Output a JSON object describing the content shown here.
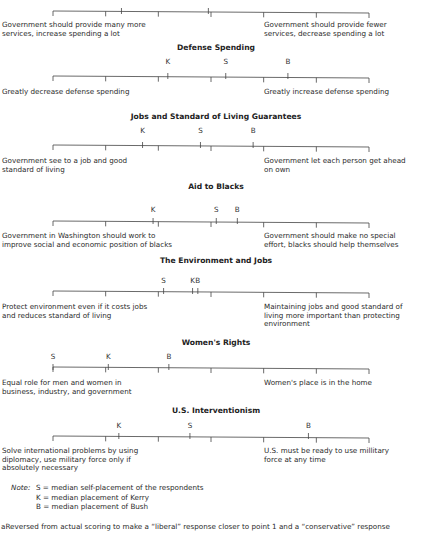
{
  "scale": {
    "x_start": 53,
    "x_end": 369,
    "points": 7
  },
  "sections": [
    {
      "id": "services",
      "title": "",
      "line_y": 12,
      "extra_ticks": [
        2.3,
        3.95
      ],
      "markers": [],
      "left_text": [
        "Government should provide many more",
        "services, increase spending a lot"
      ],
      "right_text": [
        "Government should provide fewer",
        "services, decrease spending a lot"
      ],
      "text_y": 21
    },
    {
      "id": "defense",
      "title": "Defense Spending",
      "title_y": 43,
      "marker_y": 57,
      "line_y": 77,
      "markers": [
        {
          "label": "K",
          "value": 3.18
        },
        {
          "label": "S",
          "value": 4.28
        },
        {
          "label": "B",
          "value": 5.46
        }
      ],
      "left_text": [
        "Greatly decrease defense spending"
      ],
      "right_text": [
        "Greatly increase defense spending"
      ],
      "text_y": 88
    },
    {
      "id": "jobs",
      "title": "Jobs and Standard of Living Guarantees",
      "title_y": 112,
      "marker_y": 126,
      "line_y": 146,
      "markers": [
        {
          "label": "K",
          "value": 2.7
        },
        {
          "label": "S",
          "value": 3.8
        },
        {
          "label": "B",
          "value": 4.8
        }
      ],
      "left_text": [
        "Government see to a job and good",
        "standard of living"
      ],
      "right_text": [
        "Government let each person get ahead",
        "on own"
      ],
      "text_y": 157
    },
    {
      "id": "aid",
      "title": "Aid to Blacks",
      "title_y": 182,
      "marker_y": 205,
      "line_y": 222,
      "markers": [
        {
          "label": "K",
          "value": 2.9
        },
        {
          "label": "S",
          "value": 4.1
        },
        {
          "label": "B",
          "value": 4.5
        }
      ],
      "left_text": [
        "Government in Washington should work to",
        "improve social and economic position of blacks"
      ],
      "right_text": [
        "Government should make no special",
        "effort, blacks should help themselves"
      ],
      "text_y": 232
    },
    {
      "id": "environment",
      "title": "The Environment and Jobs",
      "title_y": 256,
      "marker_y": 276,
      "line_y": 292,
      "markers": [
        {
          "label": "S",
          "value": 3.1
        },
        {
          "label": "K",
          "value": 3.65
        },
        {
          "label": "B",
          "value": 3.75
        }
      ],
      "left_text": [
        "Protect environment even if it costs jobs",
        "and reduces standard of living"
      ],
      "right_text": [
        "Maintaining jobs and good standard of",
        "living more important than protecting",
        "environment"
      ],
      "text_y": 303
    },
    {
      "id": "women",
      "title": "Women's Rights",
      "title_y": 338,
      "marker_y": 352,
      "line_y": 368,
      "markers": [
        {
          "label": "S",
          "value": 1.0
        },
        {
          "label": "K",
          "value": 2.05
        },
        {
          "label": "B",
          "value": 3.2
        }
      ],
      "left_text": [
        "Equal role for men and women in",
        "business, industry, and government"
      ],
      "right_text": [
        "Women's place is in the home"
      ],
      "text_y": 379
    },
    {
      "id": "interventionism",
      "title": "U.S. Interventionism",
      "title_y": 406,
      "marker_y": 421,
      "line_y": 437,
      "markers": [
        {
          "label": "K",
          "value": 2.25
        },
        {
          "label": "S",
          "value": 3.6
        },
        {
          "label": "B",
          "value": 5.85
        }
      ],
      "left_text": [
        "Solve international problems by using",
        "diplomacy, use military force only if",
        "absolutely necessary"
      ],
      "right_text": [
        "U.S. must be ready to use millitary",
        "force at any time"
      ],
      "text_y": 447
    }
  ],
  "note": {
    "prefix": "Note:",
    "lines": [
      "S = median self-placement of the respondents",
      "K = median placement of Kerry",
      "B = median placement of Bush"
    ]
  },
  "footnote": "aReversed from actual scoring to make a “liberal” response closer to point 1 and a “conservative” response"
}
